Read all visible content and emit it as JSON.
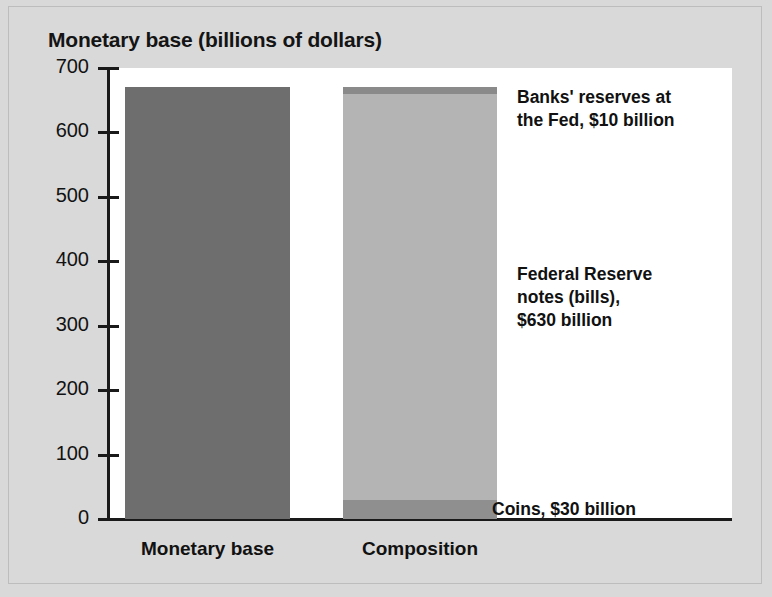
{
  "chart_data": {
    "type": "bar",
    "title": "Monetary base (billions of dollars)",
    "xlabel": "",
    "ylabel": "Monetary base (billions of dollars)",
    "ylim": [
      0,
      700
    ],
    "yticks": [
      0,
      100,
      200,
      300,
      400,
      500,
      600,
      700
    ],
    "ytick_labels": [
      "0",
      "100",
      "200",
      "300",
      "400",
      "500",
      "600",
      "700"
    ],
    "grid": false,
    "legend": "none",
    "categories": [
      "Monetary base",
      "Composition"
    ],
    "stacked": true,
    "series": [
      {
        "name": "Monetary base total",
        "values": [
          670,
          0
        ],
        "color": "#6e6e6e"
      },
      {
        "name": "Coins",
        "values": [
          0,
          30
        ],
        "color": "#8f8f8f"
      },
      {
        "name": "Federal Reserve notes (bills)",
        "values": [
          0,
          630
        ],
        "color": "#b4b4b4"
      },
      {
        "name": "Banks' reserves at the Fed",
        "values": [
          0,
          10
        ],
        "color": "#8a8a8a"
      }
    ],
    "annotations": [
      {
        "id": "reserves",
        "lines": [
          "Banks' reserves at",
          "the Fed, $10 billion"
        ],
        "value": 10
      },
      {
        "id": "notes",
        "lines": [
          "Federal Reserve",
          "notes (bills),",
          "$630 billion"
        ],
        "value": 630
      },
      {
        "id": "coins",
        "lines": [
          "Coins, $30 billion"
        ],
        "value": 30
      }
    ]
  },
  "colors": {
    "page_background": "#d9d9d9",
    "plot_background": "#ffffff",
    "axis": "#1a1a1a",
    "bar_monetary_base": "#6e6e6e",
    "segment_reserves": "#8a8a8a",
    "segment_notes": "#b4b4b4",
    "segment_coins": "#8f8f8f",
    "text": "#111111"
  }
}
